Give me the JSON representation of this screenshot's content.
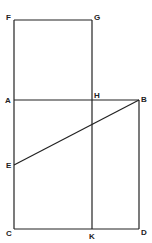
{
  "diagram": {
    "type": "geometric-figure",
    "stroke_color": "#222222",
    "background": "#ffffff",
    "points": {
      "F": {
        "x": 14,
        "y": 20
      },
      "G": {
        "x": 92,
        "y": 20
      },
      "A": {
        "x": 14,
        "y": 100
      },
      "H": {
        "x": 92,
        "y": 100
      },
      "B": {
        "x": 139,
        "y": 100
      },
      "E": {
        "x": 14,
        "y": 165
      },
      "C": {
        "x": 14,
        "y": 229
      },
      "K": {
        "x": 92,
        "y": 229
      },
      "D": {
        "x": 139,
        "y": 229
      }
    },
    "labels": {
      "F": "F",
      "G": "G",
      "A": "A",
      "H": "H",
      "B": "B",
      "E": "E",
      "C": "C",
      "K": "K",
      "D": "D"
    },
    "segments": [
      [
        "F",
        "G"
      ],
      [
        "F",
        "C"
      ],
      [
        "G",
        "K"
      ],
      [
        "A",
        "B"
      ],
      [
        "B",
        "D"
      ],
      [
        "C",
        "D"
      ],
      [
        "E",
        "B"
      ]
    ]
  }
}
